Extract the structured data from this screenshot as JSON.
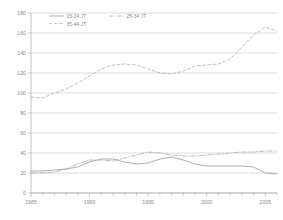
{
  "chart_data": {
    "type": "line",
    "title": "",
    "subtitle": "",
    "xlabel": "",
    "ylabel": "",
    "xlim": [
      1985,
      2006
    ],
    "ylim": [
      0,
      180
    ],
    "grid": true,
    "legend_position": "top-left",
    "y_ticks": [
      "0",
      "20",
      "40",
      "60",
      "80",
      "100",
      "120",
      "140",
      "160",
      "180"
    ],
    "y_tick_values": [
      0,
      20,
      40,
      60,
      80,
      100,
      120,
      140,
      160,
      180
    ],
    "x_ticks": [
      "1985",
      "1990",
      "1995",
      "2000",
      "2005"
    ],
    "x_tick_values": [
      1985,
      1990,
      1995,
      2000,
      2005
    ],
    "x": [
      1985,
      1986,
      1987,
      1988,
      1989,
      1990,
      1991,
      1992,
      1993,
      1994,
      1995,
      1996,
      1997,
      1998,
      1999,
      2000,
      2001,
      2002,
      2003,
      2004,
      2005,
      2006
    ],
    "series": [
      {
        "name": "15-24 JT",
        "style": "solid",
        "color": "#9a9a9a",
        "values": [
          22,
          22,
          23,
          24,
          26,
          31,
          34,
          34,
          31,
          29,
          30,
          34,
          36,
          33,
          29,
          27,
          27,
          27,
          27,
          26,
          20,
          19
        ]
      },
      {
        "name": "25-34 JT",
        "style": "dash-dot",
        "color": "#a8a8a8",
        "values": [
          20,
          20,
          21,
          24,
          29,
          33,
          33,
          32,
          35,
          38,
          41,
          40,
          38,
          37,
          37,
          38,
          39,
          40,
          41,
          41,
          42,
          42
        ]
      },
      {
        "name": "35-44 JT",
        "style": "dashed",
        "color": "#b0b0b0",
        "values": [
          96,
          95,
          100,
          104,
          110,
          117,
          124,
          128,
          129,
          128,
          124,
          120,
          119,
          122,
          127,
          128,
          129,
          134,
          146,
          158,
          166,
          162
        ]
      }
    ]
  },
  "legend": {
    "entries": [
      {
        "label": "15-24 JT"
      },
      {
        "label": "25-34 JT"
      },
      {
        "label": "35-44 JT"
      }
    ]
  }
}
